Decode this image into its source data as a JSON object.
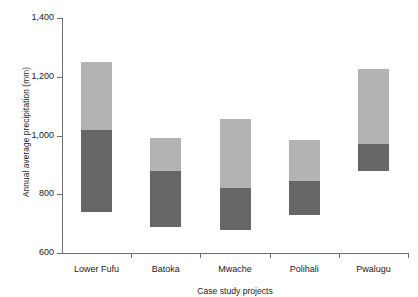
{
  "chart_data": {
    "type": "bar",
    "subtype": "floating-stacked-range",
    "title": "",
    "xlabel": "Case study projects",
    "ylabel": "Annual average precipitation (mm)",
    "categories": [
      "Lower Fufu",
      "Batoka",
      "Mwache",
      "Polihali",
      "Pwalugu"
    ],
    "ylim": [
      600,
      1400
    ],
    "yticks": [
      600,
      800,
      1000,
      1200,
      1400
    ],
    "ytick_labels": [
      "600",
      "800",
      "1,000",
      "1,200",
      "1,400"
    ],
    "grid": false,
    "legend": "none",
    "series": [
      {
        "name": "lower-segment",
        "color": "#666666",
        "base_values": [
          740,
          690,
          680,
          730,
          880
        ],
        "top_values": [
          1020,
          880,
          820,
          845,
          970
        ]
      },
      {
        "name": "upper-segment",
        "color": "#b3b3b3",
        "base_values": [
          1020,
          880,
          820,
          845,
          970
        ],
        "top_values": [
          1250,
          990,
          1055,
          985,
          1225
        ]
      }
    ],
    "bars": [
      {
        "category": "Lower Fufu",
        "min": 740,
        "mid": 1020,
        "max": 1250
      },
      {
        "category": "Batoka",
        "min": 690,
        "mid": 880,
        "max": 990
      },
      {
        "category": "Mwache",
        "min": 680,
        "mid": 820,
        "max": 1055
      },
      {
        "category": "Polihali",
        "min": 730,
        "mid": 845,
        "max": 985
      },
      {
        "category": "Pwalugu",
        "min": 880,
        "mid": 970,
        "max": 1225
      }
    ],
    "colors": {
      "upper": "#b3b3b3",
      "lower": "#666666",
      "axis": "#6d6d6d",
      "background": "#ffffff",
      "text": "#1a1a1a"
    }
  }
}
